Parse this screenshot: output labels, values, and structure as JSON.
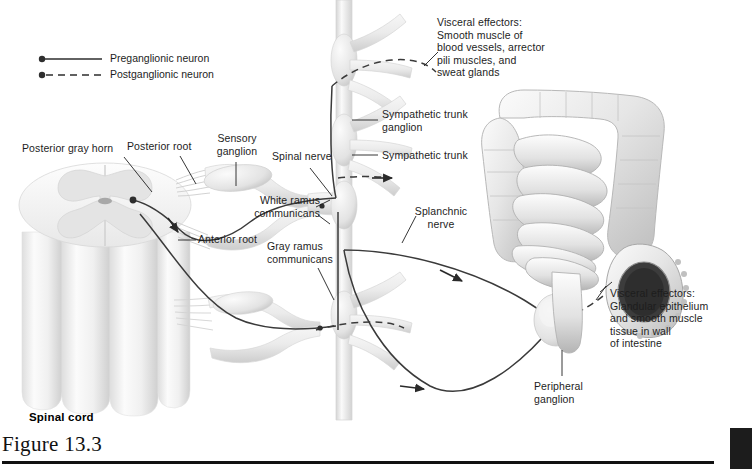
{
  "figure": {
    "caption": "Figure 13.3",
    "spinal_cord_label": "Spinal cord"
  },
  "legend": {
    "items": [
      {
        "label": "Preganglionic neuron",
        "style": "solid",
        "icon": "neuron-solid-icon"
      },
      {
        "label": "Postganglionic neuron",
        "style": "dashed",
        "icon": "neuron-dashed-icon"
      }
    ]
  },
  "labels": {
    "posterior_gray_horn": "Posterior gray horn",
    "posterior_root": "Posterior root",
    "sensory_ganglion": "Sensory\nganglion",
    "spinal_nerve": "Spinal nerve",
    "anterior_root": "Anterior root",
    "white_ramus": "White ramus\ncommunicans",
    "gray_ramus": "Gray ramus\ncommunicans",
    "sympathetic_trunk_ganglion": "Sympathetic trunk\nganglion",
    "sympathetic_trunk": "Sympathetic trunk",
    "splanchnic_nerve": "Splanchnic\nnerve",
    "peripheral_ganglion": "Peripheral\nganglion",
    "visceral_effectors_skin": "Visceral effectors:\nSmooth muscle of\nblood vessels, arrector\npili muscles, and\nsweat glands",
    "visceral_effectors_gut": "Visceral effectors:\nGlandular epithelium\nand smooth muscle\ntissue in wall\nof intestine"
  },
  "colors": {
    "ink": "#1d1d1d",
    "nerve_line": "#3a3a3a",
    "tissue_light": "#f2f2f2",
    "tissue_mid": "#dcdcdc",
    "tissue_shadow": "#bdbdbd",
    "gray_matter": "#e2e2e2",
    "rule": "#111111",
    "corner_block": "#1c1c1c"
  }
}
